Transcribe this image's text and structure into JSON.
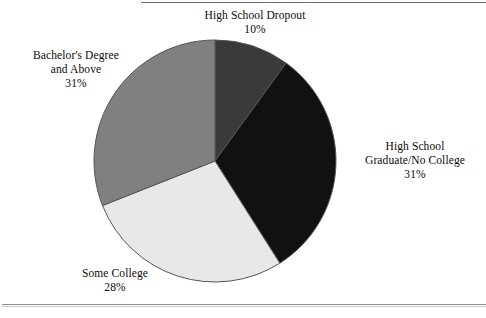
{
  "chart_data": {
    "type": "pie",
    "title": "",
    "subtitle": "",
    "xlabel": "",
    "ylabel": "",
    "legend_position": "none",
    "grid": false,
    "units": "percent",
    "total": 100,
    "categories": [
      "High School Dropout",
      "High School Graduate/No College",
      "Some College",
      "Bachelor's Degree and Above"
    ],
    "values": [
      10,
      31,
      28,
      31
    ],
    "start_angle_deg": 0,
    "direction": "clockwise",
    "slices": [
      {
        "id": "high-school-dropout",
        "label_lines": [
          "High School Dropout"
        ],
        "value": 10,
        "value_text": "10%",
        "color": "#3a3a3a",
        "start_deg": 0,
        "end_deg": 36,
        "label_position": "top"
      },
      {
        "id": "high-school-graduate-no-college",
        "label_lines": [
          "High School",
          "Graduate/No College"
        ],
        "value": 31,
        "value_text": "31%",
        "color": "#111111",
        "start_deg": 36,
        "end_deg": 147.6,
        "label_position": "right"
      },
      {
        "id": "some-college",
        "label_lines": [
          "Some College"
        ],
        "value": 28,
        "value_text": "28%",
        "color": "#e8e8e8",
        "start_deg": 147.6,
        "end_deg": 248.4,
        "label_position": "bottom-left"
      },
      {
        "id": "bachelors-degree-and-above",
        "label_lines": [
          "Bachelor's Degree",
          "and Above"
        ],
        "value": 31,
        "value_text": "31%",
        "color": "#808080",
        "start_deg": 248.4,
        "end_deg": 360,
        "label_position": "top-left"
      }
    ],
    "geometry": {
      "center_x": 215,
      "center_y": 161,
      "radius": 121,
      "outline_color": "#555555"
    }
  },
  "labels": {
    "dropout": {
      "line1": "High School Dropout",
      "pct": "10%"
    },
    "hsgrad": {
      "line1": "High School",
      "line2": "Graduate/No College",
      "pct": "31%"
    },
    "somecollege": {
      "line1": "Some College",
      "pct": "28%"
    },
    "bachelors": {
      "line1": "Bachelor's Degree",
      "line2": "and Above",
      "pct": "31%"
    }
  }
}
